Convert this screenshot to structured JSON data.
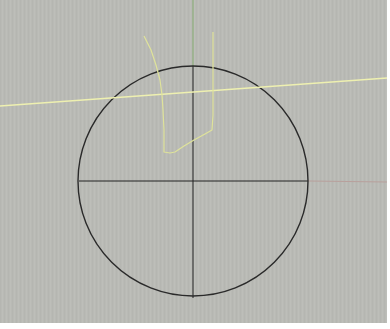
{
  "viewport": {
    "label": "Perspective viewport",
    "background": "#b9bab5",
    "border_color": "#ffffff"
  },
  "scene": {
    "circle": {
      "cx": 193,
      "cy": 181,
      "r": 115,
      "stroke": "#2a2a2a",
      "stroke_width": 1.4
    },
    "axes": {
      "x_axis_positive_color": "#b8a09c",
      "y_axis_positive_color": "#8fb07e",
      "construction_line_color": "#222222"
    },
    "curves": [
      {
        "name": "yellow-line",
        "color": "#eef0b0",
        "points": [
          [
            0,
            106
          ],
          [
            387,
            78
          ]
        ]
      },
      {
        "name": "yellow-polyline",
        "color": "#dfe39a",
        "points": [
          [
            144,
            36
          ],
          [
            151,
            50
          ],
          [
            156,
            65
          ],
          [
            160,
            80
          ],
          [
            162,
            95
          ],
          [
            163,
            110
          ],
          [
            164,
            130
          ],
          [
            164,
            152
          ],
          [
            170,
            153
          ],
          [
            175,
            152
          ],
          [
            184,
            146
          ],
          [
            194,
            140
          ],
          [
            205,
            134
          ],
          [
            212,
            130
          ],
          [
            213,
            115
          ],
          [
            213,
            90
          ],
          [
            213,
            60
          ],
          [
            213,
            32
          ]
        ]
      }
    ]
  }
}
